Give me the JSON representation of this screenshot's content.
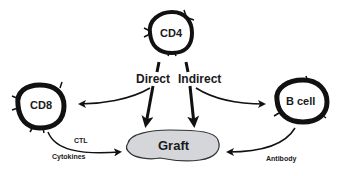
{
  "diagram": {
    "nodes": {
      "cd4": {
        "label": "CD4"
      },
      "cd8": {
        "label": "CD8"
      },
      "bcell": {
        "label": "B cell"
      },
      "graft": {
        "label": "Graft"
      }
    },
    "edges": {
      "direct": {
        "label": "Direct"
      },
      "indirect": {
        "label": "Indirect"
      },
      "ctl": {
        "label": "CTL"
      },
      "cytokines": {
        "label": "Cytokines"
      },
      "antibody": {
        "label": "Antibody"
      }
    },
    "colors": {
      "stroke": "#111111",
      "graft_fill": "#d4d6da",
      "text": "#1a1a1a"
    }
  }
}
